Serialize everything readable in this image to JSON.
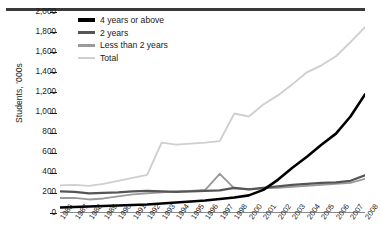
{
  "chart_data": {
    "type": "line",
    "title": "",
    "xlabel": "",
    "ylabel": "Students, '000s",
    "ylim": [
      0,
      2000
    ],
    "ytick_values": [
      0,
      200,
      400,
      600,
      800,
      1000,
      1200,
      1400,
      1600,
      1800,
      2000
    ],
    "ytick_labels": [
      "0",
      "200",
      "400",
      "600",
      "800",
      "1,000",
      "1,200",
      "1,400",
      "1,600",
      "1,800",
      "2,000"
    ],
    "grid": false,
    "legend_position": "top-left",
    "categories": [
      "1986",
      "1987",
      "1988",
      "1989",
      "1990",
      "1991",
      "1992",
      "1993",
      "1994",
      "1995",
      "1996",
      "1997",
      "1998",
      "2000",
      "2001",
      "2002",
      "2003",
      "2004",
      "2005",
      "2006",
      "2007",
      "2008"
    ],
    "series": [
      {
        "name": "4 years or above",
        "color": "#000000",
        "values": [
          55,
          60,
          65,
          70,
          75,
          80,
          85,
          95,
          105,
          115,
          125,
          140,
          155,
          175,
          230,
          330,
          450,
          560,
          680,
          790,
          960,
          1180
        ]
      },
      {
        "name": "2 years",
        "color": "#555555",
        "values": [
          215,
          210,
          195,
          200,
          205,
          215,
          220,
          215,
          210,
          215,
          220,
          225,
          250,
          235,
          250,
          265,
          280,
          290,
          300,
          305,
          320,
          375
        ]
      },
      {
        "name": "Less than 2 years",
        "color": "#9a9a9a",
        "values": [
          150,
          150,
          135,
          145,
          165,
          185,
          195,
          205,
          215,
          220,
          230,
          390,
          245,
          235,
          245,
          250,
          260,
          270,
          280,
          290,
          300,
          340
        ]
      },
      {
        "name": "Total",
        "color": "#cfcfcf",
        "values": [
          275,
          280,
          270,
          290,
          320,
          350,
          380,
          700,
          680,
          690,
          700,
          715,
          990,
          960,
          1080,
          1170,
          1280,
          1400,
          1470,
          1560,
          1700,
          1850
        ]
      }
    ]
  },
  "legend": {
    "items": [
      {
        "label": "4 years or above",
        "color": "#000000"
      },
      {
        "label": "2 years",
        "color": "#555555"
      },
      {
        "label": "Less than 2 years",
        "color": "#9a9a9a"
      },
      {
        "label": "Total",
        "color": "#cfcfcf"
      }
    ]
  }
}
